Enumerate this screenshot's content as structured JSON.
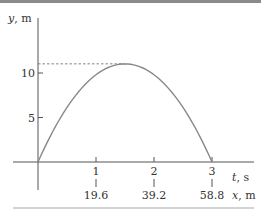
{
  "chart_data": {
    "type": "line",
    "title": "",
    "xlabel": "t, s",
    "xlabel_var": "t",
    "xlabel_unit": ", s",
    "secondary_xlabel": "x, m",
    "secondary_xlabel_var": "x",
    "secondary_xlabel_unit": ", m",
    "ylabel": "y, m",
    "ylabel_var": "y",
    "ylabel_unit": ", m",
    "xlim": [
      0,
      3.3
    ],
    "ylim": [
      0,
      14
    ],
    "x_ticks": [
      {
        "value": 1,
        "label": "1"
      },
      {
        "value": 2,
        "label": "2"
      },
      {
        "value": 3,
        "label": "3"
      }
    ],
    "secondary_x_ticks": [
      {
        "value": 1,
        "label": "19.6"
      },
      {
        "value": 2,
        "label": "39.2"
      },
      {
        "value": 3,
        "label": "58.8"
      }
    ],
    "y_ticks": [
      {
        "value": 5,
        "label": "5"
      },
      {
        "value": 10,
        "label": "10"
      }
    ],
    "grid": false,
    "legend": null,
    "series": [
      {
        "name": "y(t) trajectory",
        "x": [
          0,
          0.25,
          0.5,
          0.75,
          1.0,
          1.25,
          1.5,
          1.75,
          2.0,
          2.25,
          2.5,
          2.75,
          3.0
        ],
        "values": [
          0,
          3.37,
          6.13,
          8.27,
          9.8,
          10.72,
          11.03,
          10.72,
          9.8,
          8.27,
          6.13,
          3.37,
          0
        ],
        "color": "#888888"
      }
    ],
    "annotations": [
      {
        "type": "dashed-hline",
        "y": 11.03,
        "from_x": 0,
        "to_x": 1.5,
        "label": "max height"
      }
    ]
  }
}
